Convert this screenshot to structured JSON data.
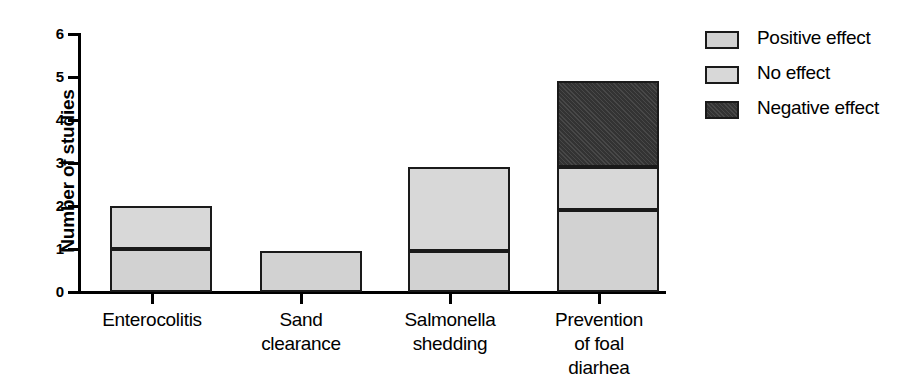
{
  "chart_data": {
    "type": "bar",
    "stacked": true,
    "title": "",
    "xlabel": "",
    "ylabel": "Number of studies",
    "ylim": [
      0,
      6
    ],
    "yticks": [
      0,
      1,
      2,
      3,
      4,
      5,
      6
    ],
    "ytick_labels": [
      "0",
      "1",
      "2",
      "3",
      "4",
      "5",
      "6"
    ],
    "grid": false,
    "legend_position": "right",
    "categories": [
      "Enterocolitis",
      "Sand clearance",
      "Salmonella shedding",
      "Prevention of foal diarhea"
    ],
    "category_lines": [
      [
        "Enterocolitis"
      ],
      [
        "Sand",
        "clearance"
      ],
      [
        "Salmonella",
        "shedding"
      ],
      [
        "Prevention",
        "of foal",
        "diarhea"
      ]
    ],
    "series": [
      {
        "name": "Positive effect",
        "color": "#d2d2d2",
        "values": [
          1.0,
          0.95,
          0.95,
          1.9
        ]
      },
      {
        "name": "No effect",
        "color": "#d8d8d8",
        "values": [
          1.0,
          0.0,
          1.95,
          1.0
        ]
      },
      {
        "name": "Negative effect",
        "color": "#3a3a3a",
        "values": [
          0.0,
          0.0,
          0.0,
          2.0
        ]
      }
    ],
    "bar_totals": [
      2.0,
      0.95,
      2.9,
      4.9
    ]
  },
  "legend": {
    "items": [
      {
        "label": "Positive effect"
      },
      {
        "label": "No effect"
      },
      {
        "label": "Negative effect"
      }
    ]
  },
  "axis": {
    "y_title": "Number of studies"
  }
}
